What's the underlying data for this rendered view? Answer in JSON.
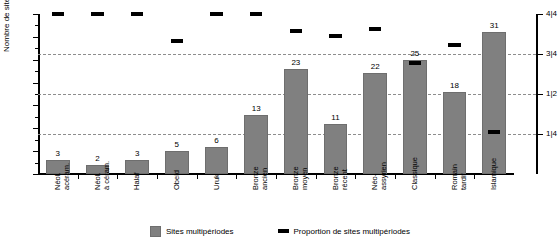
{
  "chart_data": {
    "type": "bar",
    "title": "",
    "xlabel": "",
    "ylabel": "Nombre de sites",
    "ylim": [
      0,
      35
    ],
    "yticks": [
      0,
      5,
      10,
      15,
      20,
      25,
      30,
      35
    ],
    "right_axis": {
      "label": "",
      "ticks": [
        "1|4",
        "1|2",
        "3|4",
        "4|4"
      ],
      "tick_values": [
        8.75,
        17.5,
        26.25,
        35
      ]
    },
    "grid": "horizontal dashed at 8.75, 17.5, 26.25",
    "legend_position": "bottom",
    "categories": [
      "Néol. acéram.",
      "Néol. à céram.",
      "Halaf",
      "Obeid",
      "Uruk",
      "Bronze ancien",
      "Bronze moyen",
      "Bronze récent",
      "Néo-assyrien",
      "Classique",
      "Romain tardif",
      "Islamique"
    ],
    "categories_lines": [
      [
        "Néol.",
        "acéram."
      ],
      [
        "Néol.",
        "à céram."
      ],
      [
        "Halaf",
        ""
      ],
      [
        "Obeid",
        ""
      ],
      [
        "Uruk",
        ""
      ],
      [
        "Bronze",
        "ancien"
      ],
      [
        "Bronze",
        "moyen"
      ],
      [
        "Bronze",
        "récent"
      ],
      [
        "Néo-",
        "assyrien"
      ],
      [
        "Classique",
        ""
      ],
      [
        "Romain",
        "tardif"
      ],
      [
        "Islamique",
        ""
      ]
    ],
    "series": [
      {
        "name": "Sites multipériodes",
        "type": "bar",
        "values": [
          3,
          2,
          3,
          5,
          6,
          13,
          23,
          11,
          22,
          25,
          18,
          31
        ],
        "color": "#808080"
      },
      {
        "name": "Proportion de sites multipériodes",
        "type": "marker",
        "values": [
          35,
          35,
          35,
          29.2,
          35,
          35,
          31.3,
          30.2,
          31.8,
          24.2,
          28.2,
          9.2
        ],
        "color": "#000000"
      }
    ]
  },
  "legend": {
    "items": [
      {
        "label": "Sites multipériodes",
        "icon": "square-swatch"
      },
      {
        "label": "Proportion de sites multipériodes",
        "icon": "dash-swatch"
      }
    ]
  }
}
